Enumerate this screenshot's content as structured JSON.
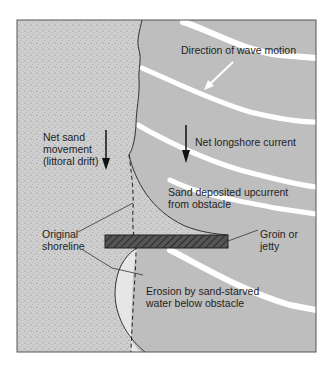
{
  "diagram": {
    "colors": {
      "water": "#bebebe",
      "sand": "#cfcfcf",
      "sand_dots": "#7a7a7a",
      "eroded_beach": "#e6e6e6",
      "wave_crest": "#ffffff",
      "groin_fill": "#555555",
      "outline": "#333333"
    },
    "labels": {
      "wave_direction": "Direction of wave motion",
      "longshore_current": "Net longshore current",
      "sand_movement": [
        "Net sand",
        "movement",
        "(littoral drift)"
      ],
      "sand_deposited": [
        "Sand deposited upcurrent",
        "from obstacle"
      ],
      "groin": [
        "Groin or",
        "jetty"
      ],
      "original_shoreline": [
        "Original",
        "shoreline"
      ],
      "erosion": [
        "Erosion by sand-starved",
        "water below obstacle"
      ]
    },
    "elements": [
      {
        "name": "land/beach (sand)",
        "pattern": "stippled"
      },
      {
        "name": "ocean",
        "pattern": "flat gray with white wave crests"
      },
      {
        "name": "groin",
        "pattern": "dark hatched rectangle"
      },
      {
        "name": "original shoreline",
        "style": "dashed line"
      },
      {
        "name": "eroded area",
        "pattern": "light gray"
      }
    ]
  }
}
